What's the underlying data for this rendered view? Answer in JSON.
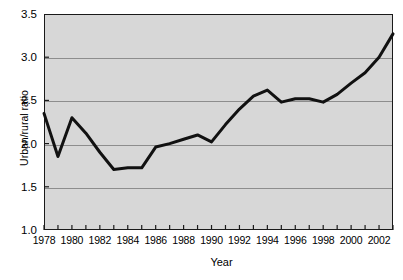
{
  "chart_data": {
    "type": "line",
    "title": "",
    "xlabel": "Year",
    "ylabel": "Urban/rural ratio",
    "xlim": [
      1978,
      2003
    ],
    "ylim": [
      1.0,
      3.5
    ],
    "grid": true,
    "legend": false,
    "x_tick_labels": [
      "1978",
      "1980",
      "1982",
      "1984",
      "1986",
      "1988",
      "1990",
      "1992",
      "1994",
      "1996",
      "1998",
      "2000",
      "2002"
    ],
    "y_tick_labels": [
      "1.0",
      "1.5",
      "2.0",
      "2.5",
      "3.0",
      "3.5"
    ],
    "x": [
      1978,
      1979,
      1980,
      1981,
      1982,
      1983,
      1984,
      1985,
      1986,
      1987,
      1988,
      1989,
      1990,
      1991,
      1992,
      1993,
      1994,
      1995,
      1996,
      1997,
      1998,
      1999,
      2000,
      2001,
      2002,
      2003
    ],
    "values": [
      2.35,
      1.85,
      2.3,
      2.12,
      1.9,
      1.7,
      1.72,
      1.72,
      1.96,
      2.0,
      2.05,
      2.1,
      2.02,
      2.22,
      2.4,
      2.55,
      2.62,
      2.48,
      2.52,
      2.52,
      2.48,
      2.57,
      2.7,
      2.82,
      3.0,
      3.27
    ],
    "series": [
      {
        "name": "Urban/rural ratio",
        "color": "#111111",
        "values": [
          2.35,
          1.85,
          2.3,
          2.12,
          1.9,
          1.7,
          1.72,
          1.72,
          1.96,
          2.0,
          2.05,
          2.1,
          2.02,
          2.22,
          2.4,
          2.55,
          2.62,
          2.48,
          2.52,
          2.52,
          2.48,
          2.57,
          2.7,
          2.82,
          3.0,
          3.27
        ]
      }
    ],
    "colors": {
      "plot_background": "#d7d7d7",
      "gridline": "#8d8d8d",
      "axis": "#1a1a1a",
      "line": "#111111",
      "figure_background": "#ffffff"
    }
  }
}
